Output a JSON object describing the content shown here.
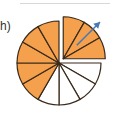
{
  "label": "h)",
  "diagram": {
    "type": "fraction-pie",
    "total_slices": 12,
    "shaded_slices": 8,
    "slices": [
      {
        "index": 0,
        "shaded": true,
        "exploded": true
      },
      {
        "index": 1,
        "shaded": true,
        "exploded": true
      },
      {
        "index": 2,
        "shaded": true,
        "exploded": true
      },
      {
        "index": 3,
        "shaded": false,
        "exploded": false
      },
      {
        "index": 4,
        "shaded": false,
        "exploded": false
      },
      {
        "index": 5,
        "shaded": false,
        "exploded": false
      },
      {
        "index": 6,
        "shaded": false,
        "exploded": false
      },
      {
        "index": 7,
        "shaded": true,
        "exploded": false
      },
      {
        "index": 8,
        "shaded": true,
        "exploded": false
      },
      {
        "index": 9,
        "shaded": true,
        "exploded": false
      },
      {
        "index": 10,
        "shaded": true,
        "exploded": false
      },
      {
        "index": 11,
        "shaded": true,
        "exploded": false
      }
    ],
    "colors": {
      "shaded": "#f5a04c",
      "unshaded": "#ffffff",
      "stroke": "#3a2a1a",
      "arrow": "#4a78b5"
    },
    "arrow_direction": "up-right"
  }
}
